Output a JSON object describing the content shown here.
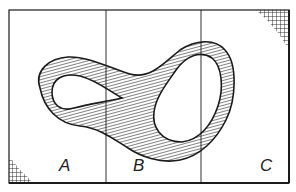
{
  "diagram": {
    "regions": [
      {
        "id": "A",
        "label": "A"
      },
      {
        "id": "B",
        "label": "B"
      },
      {
        "id": "C",
        "label": "C"
      }
    ],
    "corner_hatching": [
      "bottom-left",
      "top-right"
    ],
    "colors": {
      "ink": "#1a1a1a",
      "background": "#ffffff"
    }
  }
}
